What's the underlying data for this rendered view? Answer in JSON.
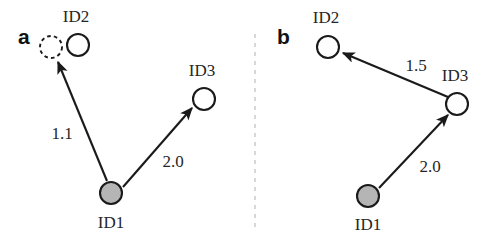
{
  "figure": {
    "width": 500,
    "height": 241,
    "background": "#ffffff",
    "divider": {
      "name": "panel-divider",
      "x": 255,
      "y1": 34,
      "y2": 231,
      "color": "#c8c8c8",
      "dash": "4 5"
    }
  },
  "colors": {
    "stroke": "#1a1a1a",
    "node_fill_open": "#ffffff",
    "node_fill_gray": "#b5b5b5",
    "text": "#262626",
    "divider": "#c8c8c8"
  },
  "panels": [
    {
      "id": "panel-a",
      "letter": "a",
      "letter_x": 18,
      "letter_y": 44,
      "nodes": [
        {
          "id": "a-id2-ghost",
          "label": "",
          "kind": "dashed-open",
          "cx": 51,
          "cy": 47,
          "r": 11
        },
        {
          "id": "a-id2",
          "label": "ID2",
          "kind": "open",
          "cx": 78,
          "cy": 45,
          "r": 11,
          "label_x": 76,
          "label_y": 22
        },
        {
          "id": "a-id3",
          "label": "ID3",
          "kind": "open",
          "cx": 204,
          "cy": 99,
          "r": 11,
          "label_x": 202,
          "label_y": 76
        },
        {
          "id": "a-id1",
          "label": "ID1",
          "kind": "filled",
          "cx": 111,
          "cy": 193,
          "r": 11,
          "label_x": 111,
          "label_y": 228
        }
      ],
      "edges": [
        {
          "id": "a-edge-id1-id2",
          "from": "ID1",
          "to": "ID2",
          "value": "1.1",
          "x1": 107,
          "y1": 181,
          "x2": 58,
          "y2": 62,
          "label_x": 62,
          "label_y": 139
        },
        {
          "id": "a-edge-id1-id3",
          "from": "ID1",
          "to": "ID3",
          "value": "2.0",
          "x1": 123,
          "y1": 187,
          "x2": 192,
          "y2": 108,
          "label_x": 173,
          "label_y": 167
        }
      ]
    },
    {
      "id": "panel-b",
      "letter": "b",
      "letter_x": 277,
      "letter_y": 44,
      "nodes": [
        {
          "id": "b-id2",
          "label": "ID2",
          "kind": "open",
          "cx": 328,
          "cy": 47,
          "r": 11,
          "label_x": 326,
          "label_y": 23
        },
        {
          "id": "b-id3",
          "label": "ID3",
          "kind": "open",
          "cx": 457,
          "cy": 104,
          "r": 11,
          "label_x": 455,
          "label_y": 81
        },
        {
          "id": "b-id1",
          "label": "ID1",
          "kind": "filled",
          "cx": 368,
          "cy": 196,
          "r": 11,
          "label_x": 368,
          "label_y": 230
        }
      ],
      "edges": [
        {
          "id": "b-edge-id3-id2",
          "from": "ID3",
          "to": "ID2",
          "value": "1.5",
          "x1": 448,
          "y1": 97,
          "x2": 343,
          "y2": 53,
          "label_x": 416,
          "label_y": 71
        },
        {
          "id": "b-edge-id1-id3",
          "from": "ID1",
          "to": "ID3",
          "value": "2.0",
          "x1": 379,
          "y1": 188,
          "x2": 448,
          "y2": 115,
          "label_x": 430,
          "label_y": 172
        }
      ]
    }
  ]
}
